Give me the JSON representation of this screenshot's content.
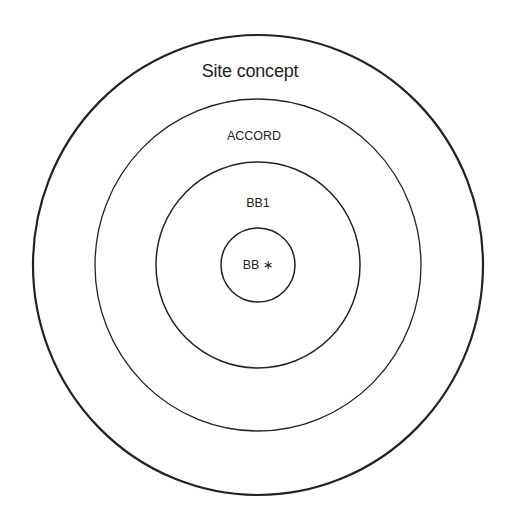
{
  "diagram": {
    "type": "concentric-circles",
    "stroke_color": "#222222",
    "background": "#ffffff",
    "center": {
      "x": 258,
      "y": 265
    },
    "rings": [
      {
        "id": "site-concept",
        "label": "Site concept",
        "rx": 225,
        "ry": 230,
        "stroke_width": 2.2,
        "label_pos": {
          "x": 250,
          "y": 71
        }
      },
      {
        "id": "accord",
        "label": "ACCORD",
        "rx": 163,
        "ry": 166,
        "stroke_width": 1.3,
        "label_pos": {
          "x": 254,
          "y": 136
        }
      },
      {
        "id": "bb1",
        "label": "BB1",
        "rx": 102,
        "ry": 103,
        "stroke_width": 1.5,
        "label_pos": {
          "x": 258,
          "y": 203
        }
      },
      {
        "id": "bb-star",
        "label": "BB ∗",
        "rx": 37,
        "ry": 37,
        "stroke_width": 1.5,
        "label_pos": {
          "x": 258,
          "y": 265
        }
      }
    ]
  }
}
